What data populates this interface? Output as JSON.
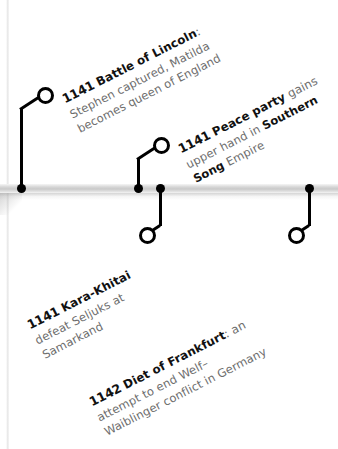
{
  "timeline": {
    "axis_color": "#c9c9c9",
    "marker_color": "#000000",
    "heading_color": "#111111",
    "body_color": "#6d6d6d",
    "events": [
      {
        "id": "battle-of-lincoln",
        "year": "1141",
        "heading": "Battle of Lincoln",
        "heading_suffix": ":",
        "lines": [
          "Stephen captured, Matilda",
          "becomes queen of England"
        ],
        "full_text": "1141 Battle of Lincoln: Stephen captured, Matilda becomes queen of England"
      },
      {
        "id": "peace-party-song",
        "year": "1141",
        "heading": "Peace party",
        "heading_tail": " gains",
        "lines": [
          "upper hand in ",
          "Song Empire"
        ],
        "bold_inline_1": "Southern",
        "bold_inline_2": "Song",
        "line2_tail": " Empire",
        "full_text": "1141 Peace party gains upper hand in Southern Song Empire"
      },
      {
        "id": "kara-khitai-samarkand",
        "year": "1141",
        "heading": "Kara-Khitai",
        "lines": [
          "defeat Seljuks at",
          "Samarkand"
        ],
        "full_text": "1141 Kara-Khitai defeat Seljuks at Samarkand"
      },
      {
        "id": "diet-of-frankfurt",
        "year": "1142",
        "heading": "Diet of Frankfurt",
        "heading_tail": ": an",
        "lines": [
          "attempt to end Welf–",
          "Waiblinger conflict in Germany"
        ],
        "full_text": "1142 Diet of Frankfurt: an attempt to end Welf–Waiblinger conflict in Germany"
      }
    ]
  }
}
